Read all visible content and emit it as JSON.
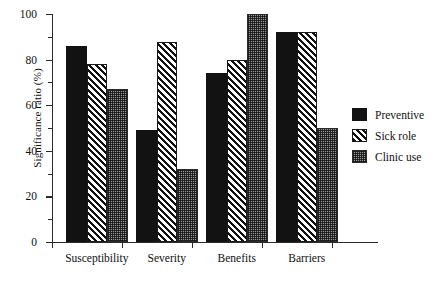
{
  "chart_data": {
    "type": "bar",
    "title": "",
    "xlabel": "",
    "ylabel": "Significance ratio (%)",
    "ylim": [
      0,
      100
    ],
    "yticks": [
      0,
      20,
      40,
      60,
      80,
      100
    ],
    "ytick_labels": [
      "0",
      "20",
      "40",
      "60",
      "80",
      "100"
    ],
    "minor_ticks": [
      10,
      30,
      50,
      70,
      90
    ],
    "grid": false,
    "legend_position": "right",
    "categories": [
      "Susceptibility",
      "Severity",
      "Benefits",
      "Barriers"
    ],
    "series": [
      {
        "name": "Preventive",
        "pattern": "solid-black",
        "color": "#121212",
        "values": [
          86,
          49,
          74,
          92
        ]
      },
      {
        "name": "Sick role",
        "pattern": "diagonal-hatch",
        "color": "#1a1a1a",
        "values": [
          78,
          88,
          80,
          92
        ]
      },
      {
        "name": "Clinic use",
        "pattern": "checker-gray",
        "color": "#9a9a9a",
        "values": [
          67,
          32,
          100,
          50
        ]
      }
    ]
  },
  "legend": {
    "items": [
      {
        "label": "Preventive",
        "swatch": "solid-black-swatch"
      },
      {
        "label": "Sick role",
        "swatch": "diagonal-hatch-swatch"
      },
      {
        "label": "Clinic use",
        "swatch": "checker-gray-swatch"
      }
    ]
  }
}
